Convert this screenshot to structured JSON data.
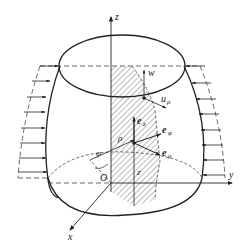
{
  "figure": {
    "axes": {
      "z": "z",
      "y": "y",
      "x": "x",
      "origin": "O"
    },
    "labels": {
      "w": "w",
      "u_rho": "u",
      "u_rho_sub": "ρ",
      "e_z": "e",
      "e_z_sub": "z",
      "e_phi": "e",
      "e_phi_sub": "φ",
      "e_rho": "e",
      "e_rho_sub": "ρ",
      "rho": "ρ",
      "phi": "φ",
      "z_coord": "z"
    },
    "colors": {
      "line": "#222222",
      "hatch": "#555555",
      "background": "#ffffff"
    }
  }
}
